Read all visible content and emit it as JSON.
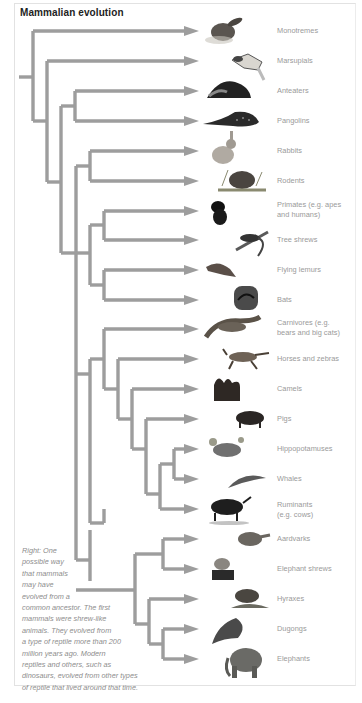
{
  "title": "Mammalian evolution",
  "colors": {
    "branch": "#9d9d9d",
    "label": "#9a9a9a",
    "title": "#222222",
    "caption": "#8d8d8d",
    "border": "#e2e2e2"
  },
  "leaves": [
    {
      "label": "Monotremes",
      "icon": "platypus-icon",
      "y": 31
    },
    {
      "label": "Marsupials",
      "icon": "sugar-glider-icon",
      "y": 61
    },
    {
      "label": "Anteaters",
      "icon": "anteater-icon",
      "y": 91
    },
    {
      "label": "Pangolins",
      "icon": "pangolin-icon",
      "y": 121
    },
    {
      "label": "Rabbits",
      "icon": "rabbit-icon",
      "y": 151
    },
    {
      "label": "Rodents",
      "icon": "rodent-icon",
      "y": 181
    },
    {
      "label_lines": [
        "Primates (e.g. apes",
        "and humans)"
      ],
      "label": "Primates (e.g. apes and humans)",
      "icon": "primate-icon",
      "y": 211
    },
    {
      "label": "Tree shrews",
      "icon": "tree-shrew-icon",
      "y": 240
    },
    {
      "label": "Flying lemurs",
      "icon": "flying-lemur-icon",
      "y": 270
    },
    {
      "label": "Bats",
      "icon": "bat-icon",
      "y": 300
    },
    {
      "label_lines": [
        "Carnivores (e.g.",
        "bears and big cats)"
      ],
      "label": "Carnivores (e.g. bears and big cats)",
      "icon": "cheetah-icon",
      "y": 329
    },
    {
      "label": "Horses and zebras",
      "icon": "horse-icon",
      "y": 359
    },
    {
      "label": "Camels",
      "icon": "camel-icon",
      "y": 389
    },
    {
      "label": "Pigs",
      "icon": "boar-icon",
      "y": 419
    },
    {
      "label": "Hippopotamuses",
      "icon": "hippo-icon",
      "y": 449
    },
    {
      "label": "Whales",
      "icon": "whale-icon",
      "y": 479
    },
    {
      "label_lines": [
        "Ruminants",
        "(e.g. cows)"
      ],
      "label": "Ruminants (e.g. cows)",
      "icon": "buffalo-icon",
      "y": 509
    },
    {
      "label": "Aardvarks",
      "icon": "aardvark-icon",
      "y": 539
    },
    {
      "label": "Elephant shrews",
      "icon": "elephant-shrew-icon",
      "y": 569
    },
    {
      "label": "Hyraxes",
      "icon": "hyrax-icon",
      "y": 599
    },
    {
      "label": "Dugongs",
      "icon": "dugong-icon",
      "y": 629
    },
    {
      "label": "Elephants",
      "icon": "elephant-icon",
      "y": 659
    }
  ],
  "caption_lines": [
    "Right: One",
    "possible way",
    "that mammals",
    "may have",
    "evolved from a",
    "common ancestor. The first",
    "mammals were shrew-like",
    "animals. They evolved from",
    "a type of reptile more than 200",
    "million years ago. Modern",
    "reptiles and others, such as",
    "dinosaurs, evolved from other types",
    "of reptile that lived around that time."
  ]
}
